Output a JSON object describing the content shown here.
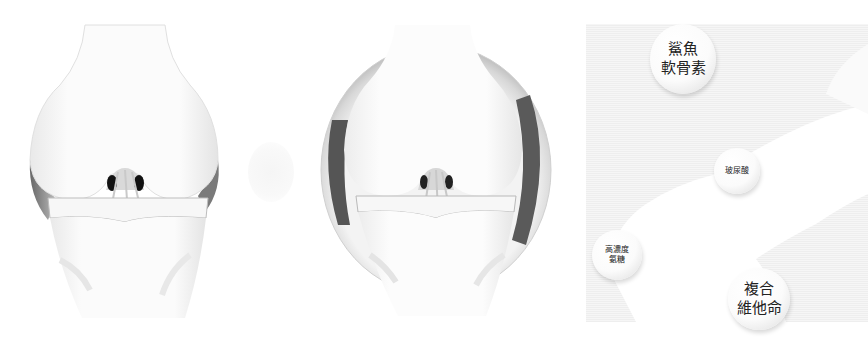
{
  "figure": {
    "panels": [
      {
        "id": "knee-normal",
        "label": ""
      },
      {
        "id": "knee-protected",
        "label": ""
      },
      {
        "id": "ingredients",
        "label": ""
      }
    ],
    "ingredients": [
      {
        "text": "鯊魚\n軟骨素",
        "meaning": "shark chondroitin"
      },
      {
        "text": "玻尿酸",
        "meaning": "hyaluronic acid"
      },
      {
        "text": "高濃度\n氨糖",
        "meaning": "high-concentration glucosamine"
      },
      {
        "text": "複合\n維他命",
        "meaning": "compound vitamins"
      }
    ],
    "colors": {
      "bone": "#fafafa",
      "cartilage_shadow": "#6e6e6e",
      "capsule_dark": "#555555",
      "panel_bg": "#f2f2f2"
    }
  }
}
